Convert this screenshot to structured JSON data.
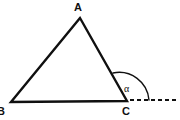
{
  "figure": {
    "type": "geometry-diagram",
    "background_color": "#ffffff",
    "stroke_color": "#101010",
    "stroke_width": 2,
    "width": 180,
    "height": 120
  },
  "vertices": [
    {
      "name": "A",
      "label": "A",
      "x": 80,
      "y": 18,
      "label_x": 74,
      "label_y": 2
    },
    {
      "name": "B",
      "label": "B",
      "x": 11,
      "y": 102,
      "label_x": -3,
      "label_y": 106
    },
    {
      "name": "C",
      "label": "C",
      "x": 127,
      "y": 101,
      "label_x": 122,
      "label_y": 106
    }
  ],
  "edges": [
    {
      "name": "side-AB",
      "from": "A",
      "to": "B",
      "style": "solid"
    },
    {
      "name": "side-AC",
      "from": "A",
      "to": "C",
      "style": "solid"
    },
    {
      "name": "side-BC",
      "from": "B",
      "to": "C",
      "style": "solid"
    }
  ],
  "extension": {
    "name": "ray-BC-extended",
    "style": "dashed",
    "from_x": 130,
    "to_x": 179,
    "y": 100,
    "dash_pattern": "4 3"
  },
  "angle": {
    "name": "exterior-angle-at-C",
    "label": "α",
    "at_vertex": "C",
    "arc_start_x": 113,
    "arc_start_y": 73,
    "arc_end_x": 148,
    "arc_end_y": 100,
    "radius": 29,
    "label_x": 124,
    "label_y": 84
  },
  "paths": {
    "triangle": "M 80 18 L 11 102 L 127 101 Z",
    "arc": "M 113 73 A 30 30 0 0 1 149 100",
    "dashed_ray": "M 130 100 L 179 100"
  }
}
